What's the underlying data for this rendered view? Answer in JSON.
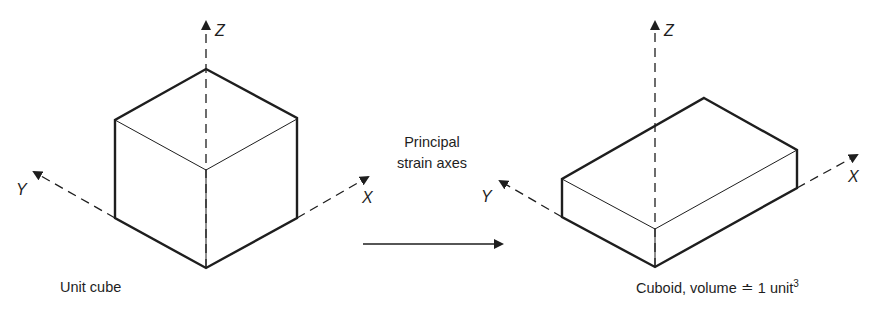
{
  "figure": {
    "left_panel": {
      "caption": "Unit cube",
      "axes": {
        "z": "Z",
        "y": "Y",
        "x": "X"
      }
    },
    "middle": {
      "line1": "Principal",
      "line2": "strain axes"
    },
    "right_panel": {
      "caption_main": "Cuboid, volume ≐ 1 unit",
      "caption_sup": "3",
      "axes": {
        "z": "Z",
        "y": "Y",
        "x": "X"
      }
    },
    "colors": {
      "ink": "#1e1e1e",
      "background": "#ffffff"
    }
  }
}
